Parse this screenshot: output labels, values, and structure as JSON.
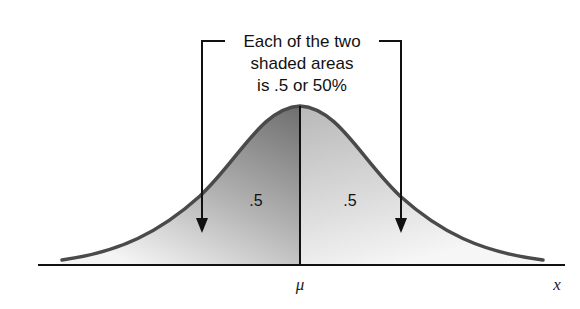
{
  "diagram": {
    "caption_lines": [
      "Each of the two",
      "shaded areas",
      "is .5 or 50%"
    ],
    "left_area_label": ".5",
    "right_area_label": ".5",
    "mean_label": "μ",
    "axis_label": "x"
  },
  "colors": {
    "curve": "#4a4a4a",
    "left_shade_top": "#7a7a7a",
    "left_shade_bottom": "#f4f4f4",
    "right_shade_top": "#bcbcbc",
    "right_shade_bottom": "#f6f6f6",
    "lines": "#111111"
  }
}
